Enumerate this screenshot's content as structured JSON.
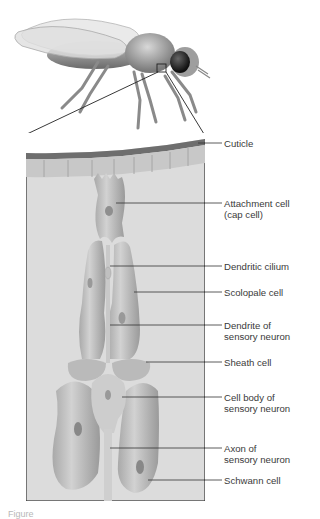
{
  "figure": {
    "panel_background": "#dcdcdc",
    "cuticle_color": "#6e6e6e",
    "cell_fill": "#bdbdbd",
    "line_color": "#333333"
  },
  "labels": [
    {
      "id": "cuticle",
      "lines": [
        "Cuticle"
      ],
      "y": 143
    },
    {
      "id": "attachment-cell",
      "lines": [
        "Attachment cell",
        "(cap cell)"
      ],
      "y": 203
    },
    {
      "id": "dendritic-cilium",
      "lines": [
        "Dendritic cilium"
      ],
      "y": 266
    },
    {
      "id": "scolopale-cell",
      "lines": [
        "Scolopale cell"
      ],
      "y": 292
    },
    {
      "id": "dendrite",
      "lines": [
        "Dendrite of",
        "sensory neuron"
      ],
      "y": 320
    },
    {
      "id": "sheath-cell",
      "lines": [
        "Sheath cell"
      ],
      "y": 362
    },
    {
      "id": "cell-body",
      "lines": [
        "Cell body of",
        "sensory neuron"
      ],
      "y": 397
    },
    {
      "id": "axon",
      "lines": [
        "Axon of",
        "sensory neuron"
      ],
      "y": 448
    },
    {
      "id": "schwann-cell",
      "lines": [
        "Schwann cell"
      ],
      "y": 480
    }
  ],
  "caption": "Figure"
}
